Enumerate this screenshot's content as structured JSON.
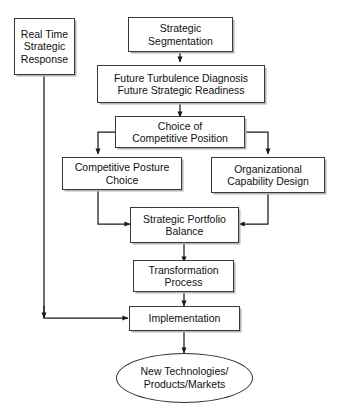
{
  "diagram": {
    "title_faint": "",
    "colors": {
      "background": "#ffffff",
      "box_border": "#3a3a3a",
      "box_fill": "#ffffff",
      "box_shadow": "#b4b4b4",
      "connector": "#1a1a1a",
      "text": "#111111"
    },
    "nodes": {
      "real_time": {
        "lines": [
          "Real Time",
          "Strategic",
          "Response"
        ]
      },
      "strategic_segmentation": {
        "lines": [
          "Strategic",
          "Segmentation"
        ]
      },
      "future_diagnosis": {
        "lines": [
          "Future Turbulence Diagnosis",
          "Future Strategic Readiness"
        ]
      },
      "choice_position": {
        "lines": [
          "Choice of",
          "Competitive Position"
        ]
      },
      "competitive_posture": {
        "lines": [
          "Competitive Posture",
          "Choice"
        ]
      },
      "organizational_capability": {
        "lines": [
          "Organizational",
          "Capability Design"
        ]
      },
      "portfolio_balance": {
        "lines": [
          "Strategic Portfolio",
          "Balance"
        ]
      },
      "transformation": {
        "lines": [
          "Transformation",
          "Process"
        ]
      },
      "implementation": {
        "lines": [
          "Implementation"
        ]
      },
      "outcome": {
        "lines": [
          "New Technologies/",
          "Products/Markets"
        ]
      }
    }
  }
}
